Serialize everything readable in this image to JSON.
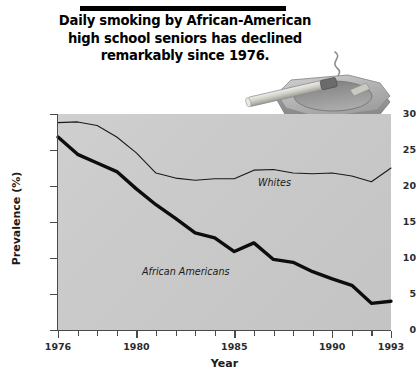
{
  "title": {
    "lines": [
      "Daily smoking by African-American",
      "high school seniors has declined",
      "remarkably since 1976."
    ]
  },
  "illustration": {
    "name": "ashtray-with-cigarette",
    "parts": [
      "octagonal-ashtray",
      "cigarette",
      "smoke-wisp"
    ],
    "colors": {
      "ashtray_top": "#b8b8b8",
      "ashtray_side": "#9a9a9a",
      "cigarette_body": "#d8d8d2",
      "cigarette_tip": "#6f6f6f",
      "smoke": "#8c8c8c"
    }
  },
  "chart_data": {
    "type": "line",
    "title": "Daily smoking by African-American high school seniors has declined remarkably since 1976.",
    "xlabel": "Year",
    "ylabel": "Prevalence (%)",
    "xlim": [
      1976,
      1993
    ],
    "ylim": [
      0,
      30
    ],
    "ytick_values": [
      0,
      5,
      10,
      15,
      20,
      25,
      30
    ],
    "ytick_labels": [
      "0",
      "5",
      "10",
      "15",
      "20",
      "25",
      "30"
    ],
    "xtick_values": [
      1976,
      1977,
      1978,
      1979,
      1980,
      1981,
      1982,
      1983,
      1984,
      1985,
      1986,
      1987,
      1988,
      1989,
      1990,
      1991,
      1992,
      1993
    ],
    "xtick_labels_major": [
      "1976",
      "1980",
      "1985",
      "1990",
      "1993"
    ],
    "xtick_major_values": [
      1976,
      1980,
      1985,
      1990,
      1993
    ],
    "grid": false,
    "legend_position": "inline-annotations",
    "plot_background": "#c9c9c9",
    "x": [
      1976,
      1977,
      1978,
      1979,
      1980,
      1981,
      1982,
      1983,
      1984,
      1985,
      1986,
      1987,
      1988,
      1989,
      1990,
      1991,
      1992,
      1993
    ],
    "series": [
      {
        "name": "Whites",
        "label": "Whites",
        "color": "#1a1a1a",
        "line_width": 1.1,
        "values": [
          28.8,
          28.9,
          28.4,
          26.8,
          24.6,
          21.8,
          21.1,
          20.8,
          21.0,
          21.0,
          22.2,
          22.3,
          21.8,
          21.7,
          21.8,
          21.4,
          20.6,
          22.5
        ]
      },
      {
        "name": "African Americans",
        "label": "African Americans",
        "color": "#0d0d0d",
        "line_width": 3.4,
        "values": [
          26.8,
          24.4,
          23.2,
          22.0,
          19.6,
          17.4,
          15.5,
          13.5,
          12.8,
          10.9,
          12.1,
          9.8,
          9.4,
          8.1,
          7.1,
          6.2,
          3.7,
          4.0
        ]
      }
    ]
  },
  "axis": {
    "x_title": "Year",
    "y_title": "Prevalence (%)"
  }
}
